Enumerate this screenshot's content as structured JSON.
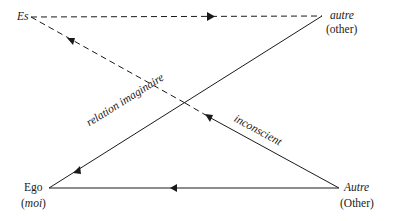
{
  "diagram": {
    "type": "Lacan Schema L",
    "nodes": {
      "es": {
        "label": "Es"
      },
      "autre_small": {
        "label": "autre",
        "gloss": "(other)"
      },
      "ego": {
        "label": "Ego",
        "gloss_open": "(",
        "gloss": "moi",
        "gloss_close": ")"
      },
      "autre_big": {
        "label": "Autre",
        "gloss": "(Other)"
      }
    },
    "edges": [
      {
        "from": "Es",
        "to": "autre",
        "style": "dashed",
        "arrow": "toward autre"
      },
      {
        "from": "Autre",
        "to": "Es",
        "style": "solid then dashed",
        "arrow": "toward Es",
        "label": "inconscient"
      },
      {
        "from": "autre",
        "to": "Ego",
        "style": "solid",
        "arrow": "toward Ego",
        "label": "relation imaginaire"
      },
      {
        "from": "Autre",
        "to": "Ego",
        "style": "solid",
        "arrow": "toward Ego"
      }
    ],
    "edge_labels": {
      "relation_imaginaire": "relation imaginaire",
      "inconscient": "inconscient"
    },
    "colors": {
      "line": "#1a1a1a",
      "background": "#ffffff"
    }
  }
}
